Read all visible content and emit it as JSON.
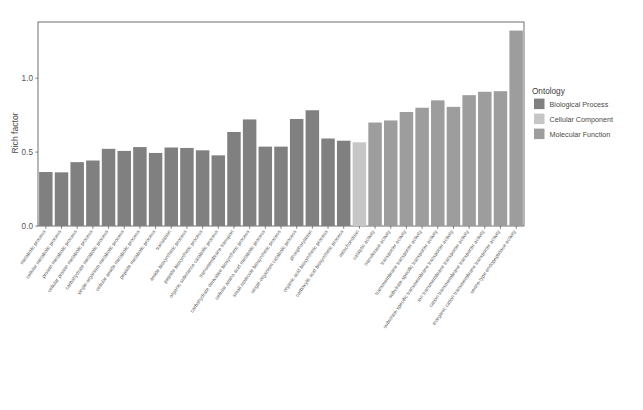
{
  "figure": {
    "y_axis_title": "Rich factor",
    "y_ticks": [
      "0.0",
      "0.5",
      "1.0"
    ],
    "legend_title": "Ontology",
    "caption": ""
  },
  "legend": {
    "items": [
      {
        "label": "Biological Process",
        "color": "#808080"
      },
      {
        "label": "Cellular Component",
        "color": "#c6c6c6"
      },
      {
        "label": "Molecular Function",
        "color": "#9d9d9d"
      }
    ]
  },
  "chart_data": {
    "type": "bar",
    "title": "",
    "xlabel": "",
    "ylabel": "Rich factor",
    "ylim": [
      0,
      1.38
    ],
    "y_ticks": [
      0.0,
      0.5,
      1.0
    ],
    "grid": false,
    "legend_position": "right",
    "legend_title": "Ontology",
    "categories": [
      "metabolic process",
      "cellular metabolic process",
      "protein metabolic process",
      "cellular protein metabolic process",
      "carbohydrate metabolic process",
      "single-organism metabolic process",
      "cellular amide metabolic process",
      "peptide metabolic process",
      "translation",
      "amide biosynthetic process",
      "peptide biosynthetic process",
      "organic substance catabolic process",
      "transmembrane transport",
      "carbohydrate derivative biosynthetic process",
      "cellular amino acid metabolic process",
      "small molecule biosynthetic process",
      "single-organism catabolic process",
      "phosphorylation",
      "organic acid biosynthetic process",
      "carboxylic acid biosynthetic process",
      "mitochondrion",
      "catalytic activity",
      "transferase activity",
      "transporter activity",
      "transmembrane transporter activity",
      "substrate-specific transporter activity",
      "substrate-specific transmembrane transporter activity",
      "ion transmembrane transporter activity",
      "cation transmembrane transporter activity",
      "inorganic cation transmembrane transporter activity",
      "serine-type endopeptidase activity"
    ],
    "values": [
      0.365,
      0.363,
      0.432,
      0.443,
      0.522,
      0.508,
      0.534,
      0.494,
      0.531,
      0.528,
      0.512,
      0.478,
      0.636,
      0.721,
      0.537,
      0.537,
      0.724,
      0.783,
      0.592,
      0.577,
      0.566,
      0.7,
      0.714,
      0.771,
      0.8,
      0.85,
      0.806,
      0.885,
      0.908,
      0.912,
      1.322
    ],
    "ontology": [
      "Biological Process",
      "Biological Process",
      "Biological Process",
      "Biological Process",
      "Biological Process",
      "Biological Process",
      "Biological Process",
      "Biological Process",
      "Biological Process",
      "Biological Process",
      "Biological Process",
      "Biological Process",
      "Biological Process",
      "Biological Process",
      "Biological Process",
      "Biological Process",
      "Biological Process",
      "Biological Process",
      "Biological Process",
      "Biological Process",
      "Cellular Component",
      "Molecular Function",
      "Molecular Function",
      "Molecular Function",
      "Molecular Function",
      "Molecular Function",
      "Molecular Function",
      "Molecular Function",
      "Molecular Function",
      "Molecular Function",
      "Molecular Function"
    ],
    "colors": {
      "Biological Process": "#808080",
      "Cellular Component": "#c6c6c6",
      "Molecular Function": "#9d9d9d"
    }
  }
}
